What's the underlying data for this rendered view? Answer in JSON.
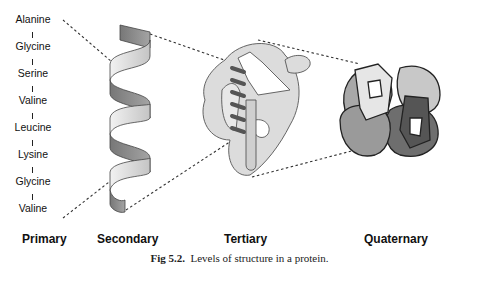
{
  "figure": {
    "caption_label": "Fig 5.2.",
    "caption_text": "Levels of structure in a protein."
  },
  "levels": [
    {
      "label": "Primary"
    },
    {
      "label": "Secondary"
    },
    {
      "label": "Tertiary"
    },
    {
      "label": "Quaternary"
    }
  ],
  "primary_sequence": [
    "Alanine",
    "Glycine",
    "Serine",
    "Valine",
    "Leucine",
    "Lysine",
    "Glycine",
    "Valine"
  ],
  "colors": {
    "ribbon_light": "#d8d8d8",
    "ribbon_dark": "#8a8a8a",
    "tertiary_fill": "#dcdcdc",
    "quat_light": "#e4e4e4",
    "quat_mid": "#a8a8a8",
    "quat_dark": "#6e6e6e",
    "outline": "#333333"
  }
}
